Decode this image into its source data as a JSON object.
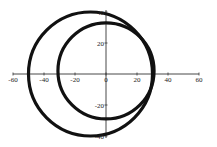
{
  "chart_data": {
    "type": "line",
    "title": "",
    "xlabel": "",
    "ylabel": "",
    "xlim": [
      -60,
      60
    ],
    "ylim": [
      -40,
      40
    ],
    "grid": false,
    "legend": null,
    "x_ticks": [
      -60,
      -40,
      -20,
      0,
      20,
      40,
      60
    ],
    "y_ticks": [
      40,
      20,
      -20,
      -40
    ],
    "x_tick_labels": [
      "-60",
      "-40",
      "-20",
      "0",
      "20",
      "40",
      "60"
    ],
    "y_tick_labels": [
      "40",
      "20",
      "-20",
      "-40"
    ],
    "series": [
      {
        "name": "outer circle",
        "shape": "circle",
        "center": [
          -10,
          0
        ],
        "radius": 40,
        "color": "#111111"
      },
      {
        "name": "inner circle",
        "shape": "circle",
        "center": [
          0,
          2
        ],
        "radius": 31,
        "color": "#111111"
      }
    ]
  }
}
